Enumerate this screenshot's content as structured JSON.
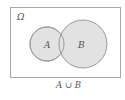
{
  "diagram": {
    "universe_label": "Ω",
    "set_a_label": "A",
    "set_b_label": "B",
    "caption": "A ∪ B",
    "colors": {
      "fill": "#e2e2e2",
      "stroke": "#9a9a9a",
      "frame": "#a8a8a8",
      "text": "#555555"
    }
  }
}
